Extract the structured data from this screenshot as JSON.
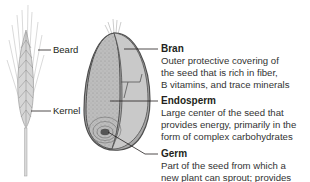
{
  "diagram": {
    "stalk_labels": [
      {
        "text": "Beard"
      },
      {
        "text": "Kernel"
      }
    ],
    "parts": [
      {
        "term": "Bran",
        "lines": [
          "Outer protective covering of",
          "the seed that is rich in fiber,",
          "B vitamins, and trace minerals"
        ]
      },
      {
        "term": "Endosperm",
        "lines": [
          "Large center of the seed that",
          "provides energy, primarily in the",
          "form of complex carbohydrates"
        ]
      },
      {
        "term": "Germ",
        "lines": [
          "Part of the seed from which a",
          "new plant can sprout; provides"
        ]
      }
    ],
    "colors": {
      "bran": "#7a7a7a",
      "endosperm": "#b8b8b8",
      "outline": "#555555",
      "leader_line": "#231f20"
    }
  }
}
